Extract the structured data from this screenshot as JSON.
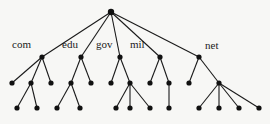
{
  "diagram": {
    "type": "tree",
    "title": "",
    "root": {
      "id": "root",
      "x": 111,
      "y": 12,
      "label": ""
    },
    "nodes": [
      {
        "id": "com",
        "x": 42,
        "y": 57,
        "label": "com",
        "label_x": 12,
        "label_y": 48
      },
      {
        "id": "edu",
        "x": 81,
        "y": 57,
        "label": "edu",
        "label_x": 62,
        "label_y": 48
      },
      {
        "id": "gov",
        "x": 120,
        "y": 57,
        "label": "gov",
        "label_x": 96,
        "label_y": 48
      },
      {
        "id": "mil",
        "x": 160,
        "y": 57,
        "label": "mil",
        "label_x": 130,
        "label_y": 48
      },
      {
        "id": "net",
        "x": 199,
        "y": 57,
        "label": "net",
        "label_x": 205,
        "label_y": 49
      },
      {
        "id": "c1",
        "x": 12,
        "y": 83,
        "label": ""
      },
      {
        "id": "c2",
        "x": 31,
        "y": 83,
        "label": ""
      },
      {
        "id": "c3",
        "x": 51,
        "y": 83,
        "label": ""
      },
      {
        "id": "e1",
        "x": 71,
        "y": 83,
        "label": ""
      },
      {
        "id": "e2",
        "x": 91,
        "y": 83,
        "label": ""
      },
      {
        "id": "g1",
        "x": 111,
        "y": 83,
        "label": ""
      },
      {
        "id": "g2",
        "x": 130,
        "y": 83,
        "label": ""
      },
      {
        "id": "m1",
        "x": 150,
        "y": 83,
        "label": ""
      },
      {
        "id": "m2",
        "x": 169,
        "y": 83,
        "label": ""
      },
      {
        "id": "n1",
        "x": 189,
        "y": 83,
        "label": ""
      },
      {
        "id": "n2",
        "x": 219,
        "y": 83,
        "label": ""
      },
      {
        "id": "c2a",
        "x": 17,
        "y": 108,
        "label": ""
      },
      {
        "id": "c2b",
        "x": 37,
        "y": 108,
        "label": ""
      },
      {
        "id": "e1a",
        "x": 57,
        "y": 108,
        "label": ""
      },
      {
        "id": "e1b",
        "x": 80,
        "y": 108,
        "label": ""
      },
      {
        "id": "g2a",
        "x": 116,
        "y": 108,
        "label": ""
      },
      {
        "id": "g2b",
        "x": 130,
        "y": 108,
        "label": ""
      },
      {
        "id": "g2c",
        "x": 150,
        "y": 108,
        "label": ""
      },
      {
        "id": "m2a",
        "x": 169,
        "y": 108,
        "label": ""
      },
      {
        "id": "n2a",
        "x": 199,
        "y": 108,
        "label": ""
      },
      {
        "id": "n2b",
        "x": 219,
        "y": 108,
        "label": ""
      },
      {
        "id": "n2c",
        "x": 239,
        "y": 108,
        "label": ""
      },
      {
        "id": "n2d",
        "x": 259,
        "y": 108,
        "label": ""
      }
    ],
    "edges": [
      [
        "root",
        "com"
      ],
      [
        "root",
        "edu"
      ],
      [
        "root",
        "gov"
      ],
      [
        "root",
        "mil"
      ],
      [
        "root",
        "net"
      ],
      [
        "com",
        "c1"
      ],
      [
        "com",
        "c2"
      ],
      [
        "com",
        "c3"
      ],
      [
        "edu",
        "e1"
      ],
      [
        "edu",
        "e2"
      ],
      [
        "gov",
        "g1"
      ],
      [
        "gov",
        "g2"
      ],
      [
        "mil",
        "m1"
      ],
      [
        "mil",
        "m2"
      ],
      [
        "net",
        "n1"
      ],
      [
        "net",
        "n2"
      ],
      [
        "c2",
        "c2a"
      ],
      [
        "c2",
        "c2b"
      ],
      [
        "e1",
        "e1a"
      ],
      [
        "e1",
        "e1b"
      ],
      [
        "g2",
        "g2a"
      ],
      [
        "g2",
        "g2b"
      ],
      [
        "g2",
        "g2c"
      ],
      [
        "m2",
        "m2a"
      ],
      [
        "n2",
        "n2a"
      ],
      [
        "n2",
        "n2b"
      ],
      [
        "n2",
        "n2c"
      ],
      [
        "n2",
        "n2d"
      ]
    ],
    "colors": {
      "line": "#1a1a1a",
      "node": "#111111",
      "background": "#f7f7f5"
    },
    "node_radius": 2.6
  }
}
